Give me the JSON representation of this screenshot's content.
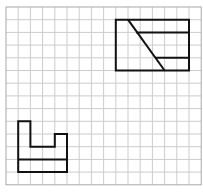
{
  "figure": {
    "type": "grid-drawing",
    "grid": {
      "columns": 16,
      "rows": 14,
      "origin_px": [
        6,
        7
      ],
      "cell_w_px": 12.2,
      "cell_h_px": 12.7,
      "line_color": "#cccccc",
      "border_color": "#a8a8a8",
      "background": "#ffffff"
    },
    "shapes": [
      {
        "name": "top-right-rectangle-view",
        "stroke": "#111111",
        "outline": [
          [
            9,
            1
          ],
          [
            15,
            1
          ],
          [
            15,
            5
          ],
          [
            9,
            5
          ]
        ],
        "segments": [
          {
            "from": [
              10,
              1
            ],
            "to": [
              13,
              5
            ],
            "kind": "diagonal"
          },
          {
            "from": [
              10.67,
              2
            ],
            "to": [
              15,
              2
            ],
            "kind": "horizontal"
          },
          {
            "from": [
              12.25,
              4
            ],
            "to": [
              15,
              4
            ],
            "kind": "horizontal"
          }
        ]
      },
      {
        "name": "bottom-left-u-shape-view",
        "stroke": "#111111",
        "outline": [
          [
            1,
            9
          ],
          [
            2,
            9
          ],
          [
            2,
            11
          ],
          [
            4,
            11
          ],
          [
            4,
            10
          ],
          [
            5,
            10
          ],
          [
            5,
            13
          ],
          [
            1,
            13
          ]
        ],
        "segments": [
          {
            "from": [
              1,
              12
            ],
            "to": [
              5,
              12
            ],
            "kind": "horizontal"
          }
        ]
      }
    ]
  }
}
